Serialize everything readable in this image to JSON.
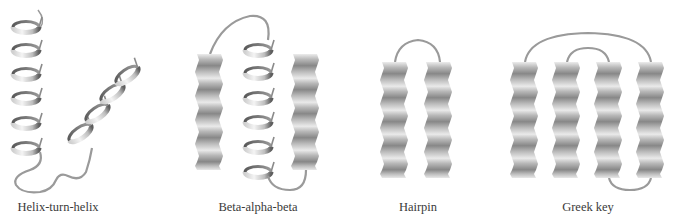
{
  "figure": {
    "colors": {
      "background": "#ffffff",
      "loop": "#9a9a9a",
      "strand_light": "#e6e6e6",
      "strand_dark": "#8c8c8c",
      "helix_light": "#f0f0f0",
      "helix_dark": "#6e6e6e",
      "label": "#3a3a3a"
    },
    "motifs": [
      {
        "id": "helix-turn-helix",
        "label": "Helix-turn-helix",
        "label_x": 58,
        "elements": [
          "alpha-helix",
          "turn",
          "alpha-helix"
        ]
      },
      {
        "id": "beta-alpha-beta",
        "label": "Beta-alpha-beta",
        "label_x": 258,
        "elements": [
          "beta-strand",
          "alpha-helix",
          "beta-strand"
        ]
      },
      {
        "id": "hairpin",
        "label": "Hairpin",
        "label_x": 418,
        "elements": [
          "beta-strand",
          "beta-strand"
        ]
      },
      {
        "id": "greek-key",
        "label": "Greek key",
        "label_x": 588,
        "elements": [
          "beta-strand",
          "beta-strand",
          "beta-strand",
          "beta-strand"
        ]
      }
    ]
  }
}
